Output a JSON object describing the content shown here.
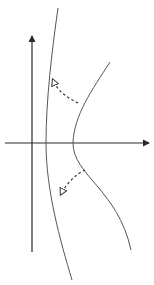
{
  "diagram": {
    "colors": {
      "background": "#ffffff",
      "axis": "#2a2a2a",
      "curve": "#555555",
      "dashed_arrow": "#333333"
    },
    "axes": {
      "x_axis": {
        "from": [
          5,
          143
        ],
        "to": [
          150,
          143
        ],
        "arrow": "right"
      },
      "y_axis": {
        "from": [
          32,
          252
        ],
        "to": [
          32,
          35
        ],
        "arrow": "up"
      }
    },
    "curves": [
      {
        "name": "left-branch",
        "path": "M58,8 C52,50 46,100 46,143 C46,190 60,240 72,280"
      },
      {
        "name": "right-branch",
        "path": "M110,62 C92,90 74,115 73,143 C73,175 118,190 131,250"
      }
    ],
    "dashed_arrows": [
      {
        "name": "upper-arrow",
        "path": "M78,103 C68,98 58,92 53,80",
        "head_at": [
          52,
          78
        ],
        "direction": "up-left"
      },
      {
        "name": "lower-arrow",
        "path": "M85,170 C76,174 66,184 61,194",
        "head_at": [
          59,
          196
        ],
        "direction": "down-left"
      }
    ]
  }
}
